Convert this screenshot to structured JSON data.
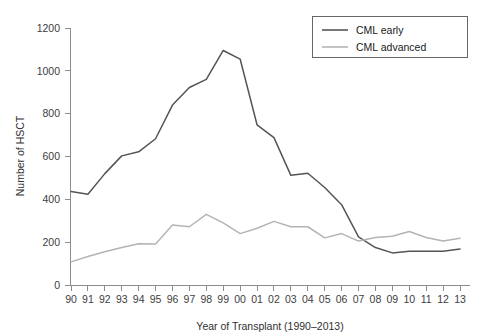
{
  "chart_data": {
    "type": "line",
    "title": "",
    "xlabel": "Year of Transplant (1990–2013)",
    "ylabel": "Number of HSCT",
    "categories": [
      "90",
      "91",
      "92",
      "93",
      "94",
      "95",
      "96",
      "97",
      "98",
      "99",
      "00",
      "01",
      "02",
      "03",
      "04",
      "05",
      "06",
      "07",
      "08",
      "09",
      "10",
      "11",
      "12",
      "13"
    ],
    "x_tick_labels": [
      "90",
      "91",
      "92",
      "93",
      "94",
      "95",
      "96",
      "97",
      "98",
      "99",
      "00",
      "01",
      "02",
      "03",
      "04",
      "05",
      "06",
      "07",
      "08",
      "09",
      "10",
      "11",
      "12",
      "13"
    ],
    "y_tick_labels": [
      "0",
      "200",
      "400",
      "600",
      "800",
      "1000",
      "1200"
    ],
    "y_ticks": [
      0,
      200,
      400,
      600,
      800,
      1000,
      1200
    ],
    "ylim": [
      0,
      1200
    ],
    "grid": false,
    "legend_position": "top-right",
    "series": [
      {
        "name": "CML early",
        "color": "#555555",
        "values": [
          437,
          424,
          520,
          603,
          622,
          683,
          840,
          922,
          960,
          1095,
          1055,
          748,
          688,
          512,
          522,
          455,
          375,
          225,
          175,
          150,
          158,
          158,
          158,
          168
        ]
      },
      {
        "name": "CML advanced",
        "color": "#b4b4b4",
        "values": [
          108,
          133,
          155,
          175,
          193,
          192,
          280,
          272,
          330,
          290,
          240,
          265,
          297,
          272,
          272,
          220,
          240,
          205,
          222,
          228,
          250,
          222,
          205,
          218
        ]
      }
    ]
  },
  "legend": {
    "items": [
      {
        "label": "CML early"
      },
      {
        "label": "CML advanced"
      }
    ]
  },
  "axes": {
    "x_title": "Year of Transplant (1990–2013)",
    "y_title": "Number of HSCT"
  }
}
